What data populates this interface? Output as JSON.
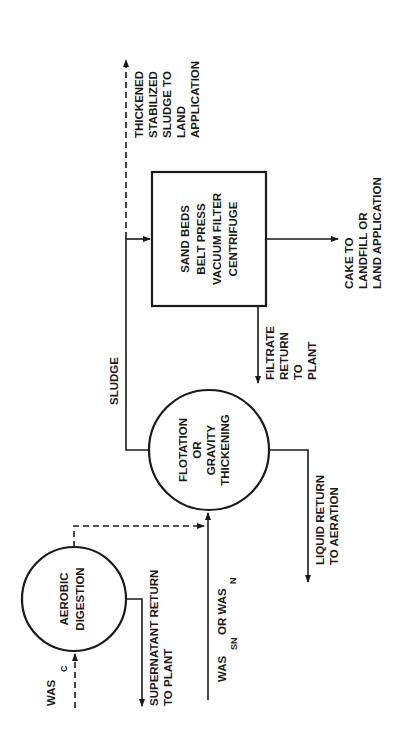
{
  "diagram": {
    "nodes": {
      "aerobic": {
        "lines": [
          "AEROBIC",
          "DIGESTION"
        ]
      },
      "thickening": {
        "lines": [
          "FLOTATION",
          "OR",
          "GRAVITY",
          "THICKENING"
        ]
      },
      "dewatering": {
        "lines": [
          "SAND BEDS",
          "BELT PRESS",
          "VACUUM FILTER",
          "CENTRIFUGE"
        ]
      }
    },
    "labels": {
      "was_c": {
        "main": "WAS",
        "sub": "C"
      },
      "supernatant": [
        "SUPERNATANT RETURN",
        "TO PLANT"
      ],
      "was_sn": {
        "main": "WAS",
        "sub": "SN",
        "or": "OR WAS",
        "sub2": "N"
      },
      "liquid_return": [
        "LIQUID RETURN",
        "TO AERATION"
      ],
      "sludge": "SLUDGE",
      "filtrate": [
        "FILTRATE",
        "RETURN",
        "TO",
        "PLANT"
      ],
      "cake": [
        "CAKE TO",
        "LANDFILL OR",
        "LAND APPLICATION"
      ],
      "thickened": [
        "THICKENED",
        "STABILIZED",
        "SLUDGE TO",
        "LAND",
        "APPLICATION"
      ]
    }
  }
}
